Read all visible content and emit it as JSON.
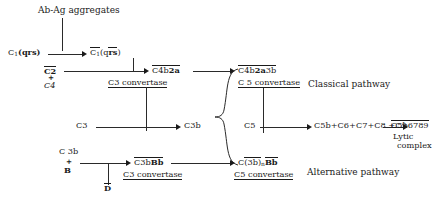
{
  "diagram": {
    "nodes": {
      "antigen": "Ab-Ag aggregates",
      "c1_inactive_pre": "C",
      "c1_inactive_sub": "1",
      "c1_inactive_tail": "(qrs)",
      "c1_active_pre": "C",
      "c1_active_sub": "1",
      "c1_active_tail_open": "(q",
      "c1_active_tail_bar": "rs",
      "c1_active_tail_close": ")",
      "c2": "C2",
      "plus_1": "+",
      "c4": "C4",
      "c4b2a_stem": "C4b",
      "c4b2a_bold": "2a",
      "c3_convertase_top": "C3 convertase",
      "c4b2a3b_stem": "C4b",
      "c4b2a3b_bold": "2a",
      "c4b2a3b_tail": "3b",
      "c5_convertase_top": "C 5 convertase",
      "classical_pathway": "Classical pathway",
      "c3": "C3",
      "c3b": "C3b",
      "c5": "C5",
      "terminal_chain": "C5b+C6+C7+C8 +C9",
      "lytic_stem": "C5b6789",
      "lytic_label_1": "Lytic",
      "lytic_label_2": "complex",
      "c3b_input": "C 3b",
      "plus_2": "+",
      "factor_b": "B",
      "factor_d": "D",
      "c3bbb_stem": "C3b",
      "c3bbb_bold": "Bb",
      "c3_convertase_bottom": "C3 convertase",
      "c3bn_open": "C(3b)",
      "c3bn_sub": "n",
      "c3bn_bold": "Bb",
      "c5_convertase_bottom": "C5 convertase",
      "alternative_pathway": "Alternative pathway"
    },
    "colors": {
      "ink": "#1a1a1a",
      "line": "#2a2a2a",
      "background": "#ffffff"
    }
  }
}
